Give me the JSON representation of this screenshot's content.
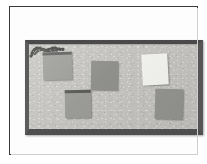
{
  "image": {
    "kind": "photograph",
    "color_mode": "grayscale",
    "subject": "framed notice board with pinned sheets of paper",
    "width": 207,
    "height": 164
  },
  "palette": {
    "page_white": "#ffffff",
    "plate_rule": "#3a3a3a",
    "board_frame_top": "#4a4a4a",
    "board_frame_left": "#5c5c5c",
    "board_frame_right": "#555555",
    "board_frame_bottom": "#4f4f4f",
    "cork_surface": "#c4c3bf",
    "sheet_gray": "#9a9a96",
    "sheet_gray_dark": "#8f8f8b",
    "sheet_white": "#f2f2ef",
    "header_band": "#5a5a58",
    "scribble_ink": "#3d3d3b"
  },
  "plate": {
    "label": "photographic plate",
    "border_rule_label": "plate rule"
  },
  "board": {
    "label": "notice board",
    "frame_label": "board frame moulding",
    "surface_label": "cork pin surface"
  },
  "sheets": [
    {
      "id": "sheet-top-left",
      "label": "top left notice",
      "fill": "#9b9b97",
      "has_header_band": true,
      "header_band_color": "#5b5b59",
      "rotation_deg": -1.5,
      "left": 14,
      "top": 7,
      "width": 29,
      "height": 28
    },
    {
      "id": "sheet-center",
      "label": "center notice with ink marking",
      "fill": "#8f8f8b",
      "has_header_band": false,
      "header_band_color": "#3d3d3b",
      "rotation_deg": 1,
      "left": 62,
      "top": 16,
      "width": 27,
      "height": 29
    },
    {
      "id": "sheet-right-white",
      "label": "white notice top right",
      "fill": "#f2f2ef",
      "has_header_band": false,
      "header_band_color": "#f2f2ef",
      "rotation_deg": -3,
      "left": 113,
      "top": 9,
      "width": 26,
      "height": 31
    },
    {
      "id": "sheet-bottom-left",
      "label": "bottom left notice",
      "fill": "#9a9a96",
      "has_header_band": true,
      "header_band_color": "#5a5a58",
      "rotation_deg": -1,
      "left": 36,
      "top": 45,
      "width": 26,
      "height": 28
    },
    {
      "id": "sheet-bottom-right",
      "label": "bottom right notice",
      "fill": "#949490",
      "has_header_band": false,
      "header_band_color": "#949490",
      "rotation_deg": 1.5,
      "left": 126,
      "top": 44,
      "width": 28,
      "height": 30
    }
  ],
  "markings": {
    "center_ink_label": "dark ink scribble across top of center notice"
  }
}
